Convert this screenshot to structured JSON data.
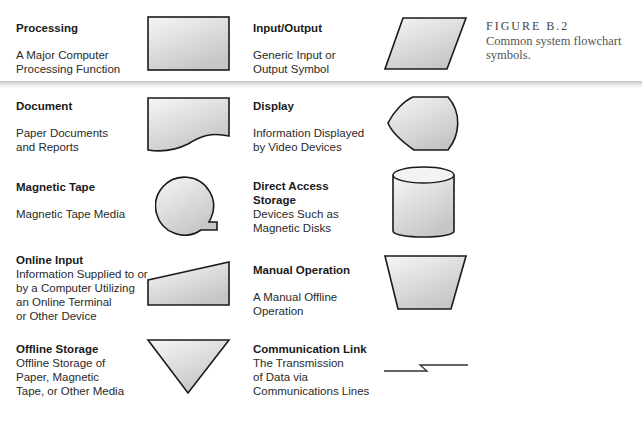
{
  "figure": {
    "number": "FIGURE B.2",
    "caption": "Common system flowchart symbols."
  },
  "symbols": [
    {
      "name": "Processing",
      "desc": [
        "A Major Computer",
        "Processing Function"
      ],
      "shape": "rectangle"
    },
    {
      "name": "Input/Output",
      "desc": [
        "Generic Input or",
        "Output Symbol"
      ],
      "shape": "parallelogram"
    },
    {
      "name": "Document",
      "desc": [
        "Paper Documents",
        "and Reports"
      ],
      "shape": "document"
    },
    {
      "name": "Display",
      "desc": [
        "Information Displayed",
        "by Video Devices"
      ],
      "shape": "display"
    },
    {
      "name": "Magnetic Tape",
      "desc": [
        "Magnetic Tape Media"
      ],
      "shape": "magnetic-tape"
    },
    {
      "name": "Direct Access Storage",
      "name_lines": [
        "Direct Access",
        "Storage"
      ],
      "desc": [
        "Devices Such as",
        "Magnetic Disks"
      ],
      "shape": "cylinder"
    },
    {
      "name": "Online Input",
      "desc": [
        "Information Supplied to or",
        "by a Computer Utilizing",
        "an Online Terminal",
        "or Other Device"
      ],
      "shape": "manual-input"
    },
    {
      "name": "Manual Operation",
      "desc": [
        "A Manual Offline",
        "Operation"
      ],
      "shape": "trapezoid"
    },
    {
      "name": "Offline Storage",
      "desc": [
        "Offline Storage of",
        "Paper, Magnetic",
        "Tape,  or Other Media"
      ],
      "shape": "triangle"
    },
    {
      "name": "Communication Link",
      "desc": [
        "The Transmission",
        "of Data via",
        "Communications Lines"
      ],
      "shape": "lightning-line"
    }
  ],
  "colors": {
    "stroke": "#1a1a1a",
    "fill_light": "#f4f4f4",
    "fill_dark": "#c9c9c9",
    "separator": "#c8c8c8"
  }
}
